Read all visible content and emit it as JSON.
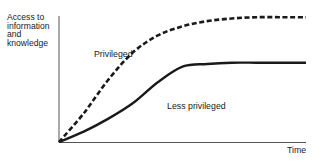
{
  "chart_data": {
    "type": "line",
    "title": "",
    "xlabel": "Time",
    "ylabel": "Access to information and knowledge",
    "ylabel_lines": [
      "Access to",
      "information",
      "and",
      "knowledge"
    ],
    "xlim": [
      0,
      10
    ],
    "ylim": [
      0,
      10
    ],
    "grid": false,
    "legend": "inline labels",
    "series": [
      {
        "name": "Privileged",
        "style": "dashed",
        "x": [
          0,
          1,
          2,
          3,
          4,
          5,
          6,
          7,
          8,
          9,
          10
        ],
        "values": [
          0,
          2.2,
          4.8,
          6.9,
          8.2,
          8.9,
          9.3,
          9.5,
          9.6,
          9.6,
          9.6
        ]
      },
      {
        "name": "Less privileged",
        "style": "solid",
        "x": [
          0,
          1,
          2,
          3,
          4,
          5,
          6,
          7,
          8,
          9,
          10
        ],
        "values": [
          0,
          0.8,
          1.8,
          3.0,
          4.6,
          5.8,
          6.0,
          6.1,
          6.1,
          6.1,
          6.1
        ]
      }
    ],
    "annotations": [
      "Privileged",
      "Less privileged"
    ]
  },
  "labels": {
    "privileged": "Privileged",
    "less_privileged": "Less privileged",
    "time": "Time"
  },
  "colors": {
    "ink": "#1a1a1a",
    "axis": "#555555",
    "background": "#ffffff"
  }
}
